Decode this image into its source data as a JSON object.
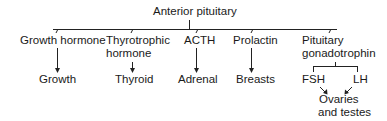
{
  "root": {
    "label": "Anterior pituitary"
  },
  "hormones": [
    {
      "label": "Growth hormone",
      "target": "Growth"
    },
    {
      "label": "Thyrotrophic hormone",
      "line1": "Thyrotrophic",
      "line2": "hormone",
      "target": "Thyroid"
    },
    {
      "label": "ACTH",
      "target": "Adrenal"
    },
    {
      "label": "Prolactin",
      "target": "Breasts"
    },
    {
      "label": "Pituitary gonadotrophin",
      "line1": "Pituitary",
      "line2": "gonadotrophin",
      "children": [
        {
          "label": "FSH"
        },
        {
          "label": "LH"
        }
      ],
      "target": "Ovaries and testes",
      "target_line1": "Ovaries",
      "target_line2": "and testes"
    }
  ],
  "colors": {
    "line": "#222222",
    "text": "#1a1a1a",
    "background": "#ffffff"
  }
}
